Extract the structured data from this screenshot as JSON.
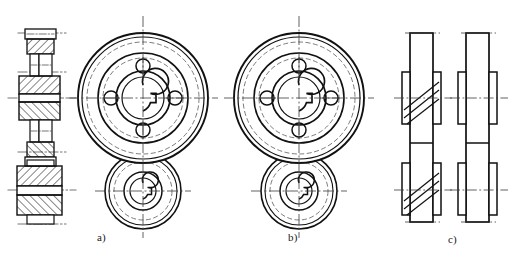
{
  "drawing": {
    "title": "V-belt pulley assembly — sectional and front views",
    "type": "mechanical-engineering-line-drawing",
    "background_color": "#ffffff",
    "line_color": "#111111",
    "centerline_color": "#3a3a3a",
    "hatch_color": "#1a1a1a"
  },
  "captions": [
    {
      "key": "a",
      "label": "a)",
      "x": 97,
      "y": 231
    },
    {
      "key": "b",
      "label": "b)",
      "x": 288,
      "y": 231
    },
    {
      "key": "c",
      "label": "c)",
      "x": 448,
      "y": 233
    }
  ],
  "views": {
    "section": {
      "name": "sectional-view",
      "description": "Longitudinal cross-section through two belt pulleys mounted on shafts, with section hatching",
      "cx": 41,
      "upper_axis_y": 98,
      "lower_axis_y": 190,
      "hatch_angle_deg": 45,
      "hatch_spacing_px": 4
    },
    "a": {
      "name": "front-view-a",
      "large_pulley": {
        "cx": 143,
        "cy": 98,
        "circles_r": [
          65,
          61,
          56,
          45,
          40,
          27,
          21
        ],
        "bore_r": 13,
        "keyway": {
          "side": "right",
          "width": 7,
          "depth": 5
        },
        "bolt_holes": {
          "count": 4,
          "pitch_r": 32,
          "hole_r": 7,
          "angles_deg": [
            0,
            90,
            180,
            270
          ]
        }
      },
      "small_pulley": {
        "cx": 143,
        "cy": 191,
        "circles_r": [
          38,
          34,
          29,
          19,
          13,
          8
        ],
        "bore_r": 8,
        "keyway": {
          "side": "right",
          "width": 5,
          "depth": 4
        }
      },
      "centerline_v_x": 143,
      "centerline_h_y": 98,
      "centerline_h2_y": 191
    },
    "b": {
      "name": "front-view-b",
      "large_pulley": {
        "cx": 299,
        "cy": 98,
        "circles_r": [
          65,
          61,
          56,
          45,
          40,
          27,
          21
        ],
        "bore_r": 13,
        "keyway": {
          "side": "right",
          "width": 7,
          "depth": 5
        },
        "bolt_holes": {
          "count": 4,
          "pitch_r": 32,
          "hole_r": 7,
          "angles_deg": [
            0,
            90,
            180,
            270
          ]
        }
      },
      "small_pulley": {
        "cx": 299,
        "cy": 191,
        "circles_r": [
          38,
          34,
          29,
          19,
          13,
          8
        ],
        "bore_r": 8,
        "keyway": {
          "side": "right",
          "width": 5,
          "depth": 4
        }
      },
      "centerline_v_x": 299,
      "centerline_h_y": 98,
      "centerline_h2_y": 191
    },
    "c": {
      "name": "side-profile-views",
      "left_profile": {
        "cx": 421,
        "body_x": 410,
        "body_w": 23,
        "top_y": 33,
        "bottom_y": 222,
        "upper_axis_y": 98,
        "lower_axis_y": 190,
        "groove_lines": 3,
        "groove_direction": "diagonal-up-right"
      },
      "right_profile": {
        "cx": 477,
        "body_x": 466,
        "body_w": 23,
        "top_y": 33,
        "bottom_y": 222,
        "upper_axis_y": 98,
        "lower_axis_y": 190,
        "groove_lines": 0,
        "groove_direction": "none"
      }
    }
  }
}
